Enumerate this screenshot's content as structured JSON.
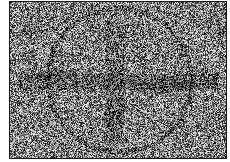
{
  "image": {
    "description": "Noisy grayscale image with faint circle and cross-shaped dark bands",
    "frame": {
      "x": 9,
      "y": 1,
      "width": 216,
      "height": 156,
      "border_color": "#1a1a1a"
    },
    "background_color": "#ffffff",
    "noise": {
      "mean_gray": 128,
      "amplitude": 120,
      "seed": 12345
    },
    "features": {
      "circle": {
        "cx": 109,
        "cy": 78,
        "r": 72,
        "darken": 38,
        "thickness": 2.2
      },
      "horizontal_band": {
        "y": 72,
        "height": 16,
        "x_from": 8,
        "x_to": 208,
        "darken": 30
      },
      "vertical_band": {
        "x": 96,
        "width": 18,
        "y_from": 20,
        "y_to": 140,
        "darken": 26
      },
      "dark_blobs": [
        {
          "cx": 48,
          "cy": 72,
          "rx": 22,
          "ry": 8,
          "darken": 35
        },
        {
          "cx": 150,
          "cy": 84,
          "rx": 40,
          "ry": 9,
          "darken": 30
        },
        {
          "cx": 22,
          "cy": 25,
          "rx": 14,
          "ry": 14,
          "darken": 22
        },
        {
          "cx": 205,
          "cy": 25,
          "rx": 10,
          "ry": 20,
          "darken": 22
        },
        {
          "cx": 105,
          "cy": 112,
          "rx": 14,
          "ry": 18,
          "darken": 22
        }
      ]
    }
  }
}
